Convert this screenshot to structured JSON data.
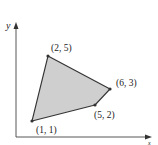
{
  "diagram": {
    "type": "polygon-plot",
    "axes": {
      "x_label": "x",
      "y_label": "y"
    },
    "polygon": {
      "fill": "#cfcfcf",
      "stroke": "#333333",
      "vertices": [
        {
          "label": "(1, 1)",
          "x": 1,
          "y": 1
        },
        {
          "label": "(5, 2)",
          "x": 5,
          "y": 2
        },
        {
          "label": "(6, 3)",
          "x": 6,
          "y": 3
        },
        {
          "label": "(2, 5)",
          "x": 2,
          "y": 5
        }
      ]
    }
  }
}
